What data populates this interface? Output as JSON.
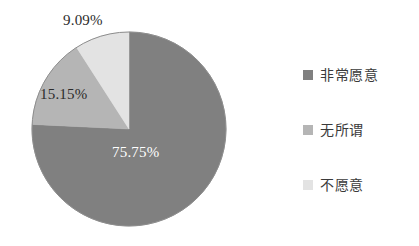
{
  "chart_data": {
    "type": "pie",
    "title": "",
    "subtitle": "",
    "xlabel": "",
    "ylabel": "",
    "grid": false,
    "legend_position": "right",
    "start_angle_deg": 90,
    "direction": "clockwise",
    "categories": [
      "非常愿意",
      "无所谓",
      "不愿意"
    ],
    "values": [
      75.75,
      15.15,
      9.09
    ],
    "labels": [
      "75.75%",
      "15.15%",
      "9.09%"
    ],
    "colors": [
      "#808080",
      "#b5b5b5",
      "#e3e3e3"
    ],
    "slices": [
      {
        "name": "非常愿意",
        "value": 75.75,
        "label": "75.75%",
        "color": "#808080",
        "label_color": "#ffffff"
      },
      {
        "name": "无所谓",
        "value": 15.15,
        "label": "15.15%",
        "color": "#b5b5b5",
        "label_color": "#2b2b2b"
      },
      {
        "name": "不愿意",
        "value": 9.09,
        "label": "9.09%",
        "color": "#e3e3e3",
        "label_color": "#2b2b2b"
      }
    ],
    "legend": [
      {
        "label": "非常愿意",
        "color": "#808080"
      },
      {
        "label": "无所谓",
        "color": "#b5b5b5"
      },
      {
        "label": "不愿意",
        "color": "#e3e3e3"
      }
    ]
  },
  "geometry": {
    "center_x": 129,
    "center_y": 129,
    "radius": 97,
    "outline_color": "#8d8d8d"
  }
}
